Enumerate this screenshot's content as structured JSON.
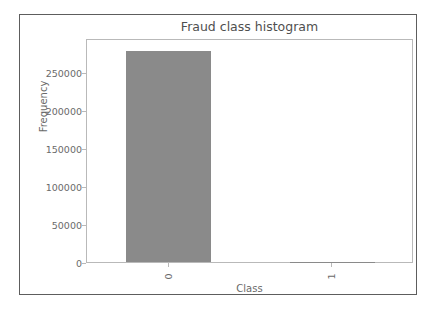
{
  "chart_data": {
    "type": "bar",
    "title": "Fraud class histogram",
    "xlabel": "Class",
    "ylabel": "Frequency",
    "categories": [
      "0",
      "1"
    ],
    "values": [
      278000,
      492
    ],
    "yticks": [
      0,
      50000,
      100000,
      150000,
      200000,
      250000
    ],
    "ytick_labels": [
      "0",
      "50000",
      "100000",
      "150000",
      "200000",
      "250000"
    ],
    "xtick_labels": [
      "0",
      "1"
    ],
    "ylim": [
      0,
      295000
    ],
    "xlim": [
      -0.5,
      1.5
    ],
    "grid": false,
    "legend": null,
    "bar_color": "#8a8a8a",
    "axes_color": "#b9b9b9",
    "text_color": "#6a6a6a",
    "title_color": "#4f4f4f",
    "frame_color": "#5d5d5d",
    "background": "#ffffff",
    "xtick_rotation": -90
  }
}
